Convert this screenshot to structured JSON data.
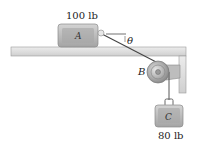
{
  "diagram": {
    "block_a": {
      "label": "A",
      "weight": "100 lb"
    },
    "block_c": {
      "label": "C",
      "weight": "80 lb"
    },
    "pulley": {
      "label": "B"
    },
    "angle": {
      "label": "θ"
    },
    "colors": {
      "block_fill": "#b8b8b8",
      "block_inner": "#9e9e9e",
      "table_fill": "#e2e2e2",
      "table_edge": "#9a9a9a",
      "cord": "#444444",
      "pulley": "#a8a8a8"
    }
  }
}
